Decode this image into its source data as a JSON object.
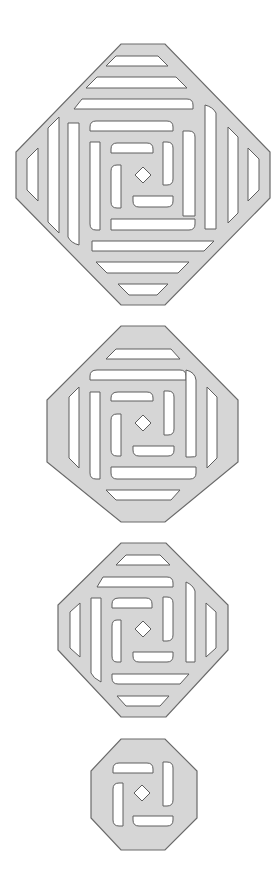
{
  "figure": {
    "colors": {
      "plate_fill": "#d6d6d6",
      "plate_stroke": "#6a6a6a",
      "slot_fill": "#ffffff",
      "slot_stroke": "#5e5e5e"
    },
    "shapes": [
      {
        "id": "plate-large",
        "center": [
          143,
          175
        ],
        "octagon": [
          [
            121,
            44
          ],
          [
            165,
            44
          ],
          [
            270,
            152
          ],
          [
            270,
            198
          ],
          [
            165,
            305
          ],
          [
            121,
            305
          ],
          [
            16,
            198
          ],
          [
            16,
            152
          ]
        ],
        "diamond_half": 8,
        "slots": [
          "M116,56 L158,56 L168,66 L106,66 Z",
          "M97,77 L176,77 L187,88 L86,88 Z",
          "M82,99 L187,99 Q193,99 193,105 L193,109 L74,109 Z",
          "M96,121 L167,121 Q173,121 173,127 L173,131 L90,131 L90,127 Q90,121 96,121 Z",
          "M117,143 L147,143 Q153,143 153,149 L153,153 L111,153 L111,149 Q111,143 117,143 Z",
          "M163,142 L167,142 Q173,142 173,148 L173,179 Q173,185 167,185 L163,185 Z",
          "M133,196 L173,196 L173,201 Q173,207 167,207 L139,207 Q133,207 133,201 Z",
          "M121,165 L121,208 L117,208 Q111,208 111,202 L111,171 Q111,165 117,165 Z",
          "M183,131 L189,131 Q195,131 195,137 L195,216 L183,216 Z",
          "M111,219 L195,219 L195,224 Q195,230 189,230 L111,230 Z",
          "M90,142 L100,142 L100,230 L96,230 Q90,230 90,224 Z",
          "M205,105 Q213,107 216,113 L216,229 L205,229 Z",
          "M92,241 L214,241 L204,251 L92,251 Z",
          "M68,123 L79,123 L79,245 Q71,243 68,237 Z",
          "M228,127 L238,137 L238,213 L228,223 Z",
          "M96,262 L189,262 L178,273 L107,273 Z",
          "M48,128 L59,117 L59,233 L48,222 Z",
          "M248,148 L259,159 L259,190 L248,201 Z",
          "M118,284 L168,284 L157,295 L129,295 Z",
          "M27,159 L38,148 L38,201 L27,190 Z"
        ]
      },
      {
        "id": "plate-medium",
        "center": [
          143,
          423
        ],
        "octagon": [
          [
            121,
            326
          ],
          [
            165,
            326
          ],
          [
            238,
            400
          ],
          [
            238,
            462
          ],
          [
            165,
            522
          ],
          [
            121,
            522
          ],
          [
            47,
            462
          ],
          [
            47,
            400
          ]
        ],
        "diamond_half": 8,
        "slots": [
          "M116,349 L171,349 L180,359 L106,359 Z",
          "M97,370 L180,370 Q186,370 186,376 L186,380 L90,380 L90,376 Q90,370 97,370 Z",
          "M118,392 L147,392 Q153,392 153,398 L153,401 L111,401 L111,398 Q111,392 118,392 Z",
          "M164,391 L168,391 Q174,391 174,397 L174,429 Q174,435 168,435 L164,435 Z",
          "M133,446 L174,446 L174,450 Q174,456 168,456 L139,456 Q133,456 133,450 Z",
          "M121,414 L121,456 L117,456 Q111,456 111,450 L111,420 Q111,414 117,414 Z",
          "M186,370 Q195,372 196,380 L196,456 Q196,457 190,457 L186,457 Z",
          "M111,467 L196,467 L196,473 Q196,479 190,479 L117,479 Q111,479 111,473 Z",
          "M90,392 L100,392 L100,479 L96,479 Q90,479 90,473 Z",
          "M207,387 L217,397 L217,458 L207,468 Z",
          "M106,490 L180,490 L171,500 L116,500 Z",
          "M69,397 L79,387 L79,468 L69,458 Z"
        ]
      },
      {
        "id": "plate-small",
        "center": [
          143,
          629
        ],
        "octagon": [
          [
            121,
            543
          ],
          [
            166,
            543
          ],
          [
            228,
            605
          ],
          [
            228,
            650
          ],
          [
            166,
            717
          ],
          [
            121,
            717
          ],
          [
            58,
            650
          ],
          [
            58,
            605
          ]
        ],
        "diamond_half": 8,
        "slots": [
          "M126,555 L160,555 L170,565 L116,565 Z",
          "M103,577 L167,577 Q173,577 173,583 L173,587 L97,587 Z",
          "M119,598 L146,598 Q152,598 152,604 L152,608 L112,608 L112,604 Q112,598 119,598 Z",
          "M163,597 L167,597 Q173,597 173,603 L173,635 Q173,641 167,641 L163,641 Z",
          "M133,652 L173,652 L173,656 Q173,662 167,662 L139,662 Q133,662 133,656 Z",
          "M121,620 L121,662 L117,662 Q112,662 112,656 L112,626 Q112,620 117,620 Z",
          "M186,582 Q193,585 195,591 L195,662 L186,662 Z",
          "M112,674 L189,674 L180,684 L118,684 Q112,684 112,678 Z",
          "M91,598 L101,598 L101,682 Q93,678 91,673 Z",
          "M206,603 L216,612 L216,648 L206,657 Z",
          "M117,696 L169,696 L160,706 L126,706 Z",
          "M70,612 L80,603 L80,657 L70,648 Z"
        ]
      },
      {
        "id": "plate-tiny",
        "center": [
          142,
          793
        ],
        "octagon": [
          [
            121,
            739
          ],
          [
            165,
            739
          ],
          [
            197,
            771
          ],
          [
            197,
            818
          ],
          [
            165,
            850
          ],
          [
            121,
            850
          ],
          [
            91,
            818
          ],
          [
            91,
            771
          ]
        ],
        "diamond_half": 8,
        "slots": [
          "M119,763 L147,763 Q153,763 153,769 L153,773 L113,773 L113,769 Q113,763 119,763 Z",
          "M163,762 L167,762 Q173,762 173,768 L173,800 Q173,806 167,806 L163,806 Z",
          "M133,816 L173,816 L173,820 Q173,826 167,826 L139,826 Q133,826 133,820 Z",
          "M123,783 L123,826 L119,826 Q113,826 113,820 L113,789 Q113,783 119,783 Z"
        ]
      }
    ]
  }
}
